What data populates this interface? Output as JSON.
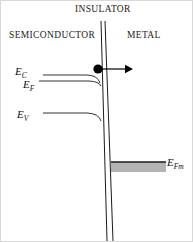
{
  "figure": {
    "width": 193,
    "height": 242,
    "background": "#ffffff",
    "line_color": "#1b1b1b",
    "metal_band_fill": "#b3b3b3"
  },
  "regions": {
    "insulator": "INSULATOR",
    "semiconductor": "SEMICONDUCTOR",
    "metal": "METAL"
  },
  "energy_levels": [
    {
      "key": "Ec",
      "symbol": "E",
      "subscript": "C",
      "label": "E_C",
      "y": 74
    },
    {
      "key": "Ef",
      "symbol": "E",
      "subscript": "F",
      "label": "E_F",
      "y": 80
    },
    {
      "key": "Ev",
      "symbol": "E",
      "subscript": "V",
      "label": "E_V",
      "y": 112
    },
    {
      "key": "Efm",
      "symbol": "E",
      "subscript": "Fm",
      "label": "E_Fm",
      "y": 161
    }
  ],
  "carrier": {
    "type": "electron",
    "marker": "filled-circle",
    "x": 97,
    "y": 68,
    "radius": 4.6,
    "color": "#000000",
    "arrow_direction": "right",
    "arrow_from_x": 97,
    "arrow_to_x": 130,
    "arrow_y": 68,
    "meaning": "tunneling"
  },
  "barrier": {
    "left_line": {
      "x_top": 100,
      "y_top": 20,
      "x_bottom": 106,
      "y_bottom": 240
    },
    "right_line": {
      "x_top": 104,
      "y_top": 20,
      "x_bottom": 112,
      "y_bottom": 240
    }
  },
  "metal_band": {
    "x_start": 110,
    "x_end": 165,
    "y_top": 161,
    "y_bottom": 171
  }
}
